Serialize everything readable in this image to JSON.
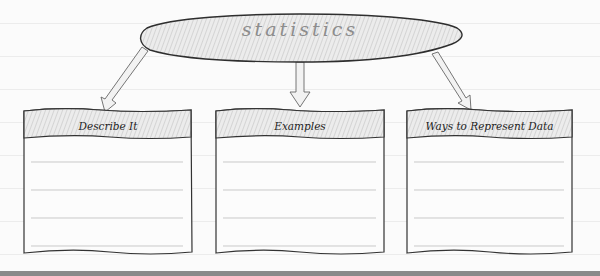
{
  "center_node": {
    "label": "statistics"
  },
  "boxes": [
    {
      "label": "Describe It",
      "lines": 4
    },
    {
      "label": "Examples",
      "lines": 4
    },
    {
      "label": "Ways to Represent Data",
      "lines": 4
    }
  ],
  "colors": {
    "outline": "#333333",
    "hatch": "#cfcfcf",
    "fill": "#e6e6e6",
    "text_center": "#8d8d8d",
    "text_box": "#222222",
    "rule": "#d8d8d8"
  }
}
